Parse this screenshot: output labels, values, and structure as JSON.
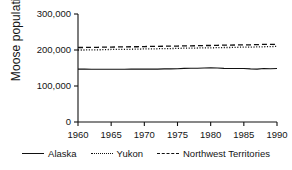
{
  "chart_data": {
    "type": "line",
    "title": "",
    "xlabel": "",
    "ylabel": "Moose population",
    "xlim": [
      1960,
      1990
    ],
    "ylim": [
      0,
      300000
    ],
    "grid": false,
    "legend_position": "bottom",
    "x_ticks": [
      "1960",
      "1965",
      "1970",
      "1975",
      "1980",
      "1985",
      "1990"
    ],
    "x_tick_values": [
      1960,
      1965,
      1970,
      1975,
      1980,
      1985,
      1990
    ],
    "y_ticks": [
      "0",
      "100,000",
      "200,000",
      "300,000"
    ],
    "y_tick_values": [
      0,
      100000,
      200000,
      300000
    ],
    "x": [
      1960,
      1961,
      1962,
      1963,
      1964,
      1965,
      1966,
      1967,
      1968,
      1969,
      1970,
      1971,
      1972,
      1973,
      1974,
      1975,
      1976,
      1977,
      1978,
      1979,
      1980,
      1981,
      1982,
      1983,
      1984,
      1985,
      1986,
      1987,
      1988,
      1989,
      1990
    ],
    "series": [
      {
        "name": "Alaska",
        "style": "solid",
        "color": "#111111",
        "values": [
          147000,
          147000,
          146500,
          146500,
          146500,
          146500,
          146500,
          146500,
          147000,
          147000,
          147000,
          147000,
          147000,
          147500,
          147500,
          148000,
          149000,
          149500,
          149500,
          150000,
          150500,
          150000,
          149000,
          148500,
          148500,
          148500,
          147500,
          147000,
          148500,
          148000,
          148500
        ]
      },
      {
        "name": "Yukon",
        "style": "dotted",
        "color": "#111111",
        "values": [
          200000,
          200000,
          200500,
          200500,
          201000,
          201500,
          201500,
          202000,
          202000,
          202500,
          203000,
          203000,
          203500,
          204000,
          204000,
          204500,
          205000,
          205000,
          205500,
          206000,
          206000,
          206500,
          207000,
          207000,
          207500,
          208000,
          208000,
          208500,
          209000,
          209500,
          210000
        ]
      },
      {
        "name": "Northwest Territories",
        "style": "dashed",
        "color": "#111111",
        "values": [
          207000,
          207000,
          207500,
          207500,
          208000,
          208000,
          208500,
          208500,
          209000,
          209000,
          209500,
          210000,
          210000,
          210500,
          210500,
          211000,
          211500,
          211500,
          212000,
          212500,
          212500,
          213000,
          213500,
          213500,
          214000,
          214500,
          214500,
          215000,
          215500,
          215500,
          216000
        ]
      }
    ],
    "legend": [
      {
        "label": "Alaska",
        "style": "solid"
      },
      {
        "label": "Yukon",
        "style": "dotted"
      },
      {
        "label": "Northwest Territories",
        "style": "dashed"
      }
    ]
  }
}
